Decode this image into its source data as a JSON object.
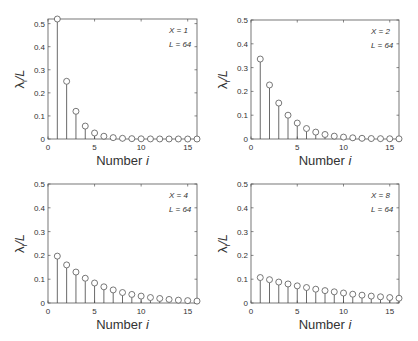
{
  "chart_data": [
    {
      "type": "bar",
      "subtype": "stem",
      "title": "",
      "annotation": [
        "X = 1",
        "L = 64"
      ],
      "xlabel": "Number i",
      "ylabel": "λi/L",
      "xlim": [
        0,
        16
      ],
      "ylim": [
        0,
        0.52
      ],
      "xticks": [
        0,
        5,
        10,
        15
      ],
      "yticks": [
        0,
        0.1,
        0.2,
        0.3,
        0.4,
        0.5
      ],
      "grid": false,
      "x": [
        1,
        2,
        3,
        4,
        5,
        6,
        7,
        8,
        9,
        10,
        11,
        12,
        13,
        14,
        15,
        16
      ],
      "values": [
        0.52,
        0.25,
        0.12,
        0.056,
        0.026,
        0.012,
        0.006,
        0.003,
        0.0015,
        0.0008,
        0.0004,
        0.0002,
        0.0001,
        0.0001,
        0.0,
        0.0
      ]
    },
    {
      "type": "bar",
      "subtype": "stem",
      "title": "",
      "annotation": [
        "X = 2",
        "L = 64"
      ],
      "xlabel": "Number i",
      "ylabel": "λi/L",
      "xlim": [
        0,
        16
      ],
      "ylim": [
        0,
        0.5
      ],
      "xticks": [
        0,
        5,
        10,
        15
      ],
      "yticks": [
        0,
        0.1,
        0.2,
        0.3,
        0.4,
        0.5
      ],
      "grid": false,
      "x": [
        1,
        2,
        3,
        4,
        5,
        6,
        7,
        8,
        9,
        10,
        11,
        12,
        13,
        14,
        15,
        16
      ],
      "values": [
        0.336,
        0.227,
        0.151,
        0.1,
        0.067,
        0.044,
        0.029,
        0.019,
        0.012,
        0.008,
        0.005,
        0.003,
        0.002,
        0.0015,
        0.001,
        0.0007
      ]
    },
    {
      "type": "bar",
      "subtype": "stem",
      "title": "",
      "annotation": [
        "X = 4",
        "L = 64"
      ],
      "xlabel": "Number i",
      "ylabel": "λi/L",
      "xlim": [
        0,
        16
      ],
      "ylim": [
        0,
        0.5
      ],
      "xticks": [
        0,
        5,
        10,
        15
      ],
      "yticks": [
        0,
        0.1,
        0.2,
        0.3,
        0.4,
        0.5
      ],
      "grid": false,
      "x": [
        1,
        2,
        3,
        4,
        5,
        6,
        7,
        8,
        9,
        10,
        11,
        12,
        13,
        14,
        15,
        16
      ],
      "values": [
        0.197,
        0.16,
        0.13,
        0.104,
        0.084,
        0.068,
        0.055,
        0.044,
        0.036,
        0.029,
        0.023,
        0.019,
        0.015,
        0.012,
        0.01,
        0.008
      ]
    },
    {
      "type": "bar",
      "subtype": "stem",
      "title": "",
      "annotation": [
        "X = 8",
        "L = 64"
      ],
      "xlabel": "Number i",
      "ylabel": "λi/L",
      "xlim": [
        0,
        16
      ],
      "ylim": [
        0,
        0.5
      ],
      "xticks": [
        0,
        5,
        10,
        15
      ],
      "yticks": [
        0,
        0.1,
        0.2,
        0.3,
        0.4,
        0.5
      ],
      "grid": false,
      "x": [
        1,
        2,
        3,
        4,
        5,
        6,
        7,
        8,
        9,
        10,
        11,
        12,
        13,
        14,
        15,
        16
      ],
      "values": [
        0.107,
        0.098,
        0.088,
        0.08,
        0.072,
        0.065,
        0.058,
        0.052,
        0.047,
        0.042,
        0.037,
        0.033,
        0.029,
        0.026,
        0.023,
        0.02
      ]
    }
  ],
  "layout": {
    "panels": [
      {
        "left": 48,
        "top": 19,
        "width": 149,
        "height": 120
      },
      {
        "left": 251,
        "top": 20,
        "width": 148,
        "height": 119
      },
      {
        "left": 48,
        "top": 184,
        "width": 149,
        "height": 119
      },
      {
        "left": 251,
        "top": 184,
        "width": 148,
        "height": 119
      }
    ],
    "colors": {
      "axis": "#555555",
      "stem": "#444444",
      "marker": "#555555",
      "text": "#333333"
    }
  }
}
